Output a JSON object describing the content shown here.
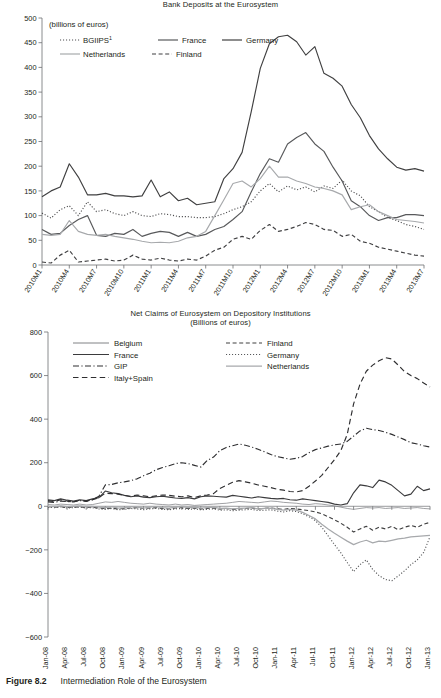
{
  "figure": {
    "number": "Figure 8.2",
    "caption": "Intermediation Role of the Eurosystem"
  },
  "chart_data": [
    {
      "id": "top",
      "type": "line",
      "title": "Bank Deposits at the Eurosystem",
      "subtitle": "(billions of euros)",
      "axis_note": "(billions of euros)",
      "xlabel": "",
      "ylabel": "",
      "ylim": [
        0,
        500
      ],
      "yticks": [
        0,
        50,
        100,
        150,
        200,
        250,
        300,
        350,
        400,
        450,
        500
      ],
      "grid": false,
      "legend_position": "top-left",
      "x": [
        "2010M1",
        "2010M2",
        "2010M3",
        "2010M4",
        "2010M5",
        "2010M6",
        "2010M7",
        "2010M8",
        "2010M9",
        "2010M10",
        "2010M11",
        "2010M12",
        "2011M1",
        "2011M2",
        "2011M3",
        "2011M4",
        "2011M5",
        "2011M6",
        "2011M7",
        "2011M8",
        "2011M9",
        "2011M10",
        "2011M11",
        "2011M12",
        "2012M1",
        "2012M2",
        "2012M3",
        "2012M4",
        "2012M5",
        "2012M6",
        "2012M7",
        "2012M8",
        "2012M9",
        "2012M10",
        "2012M11",
        "2012M12",
        "2013M1",
        "2013M2",
        "2013M3",
        "2013M4",
        "2013M5",
        "2013M6",
        "2013M7"
      ],
      "xticks": [
        "2010M1",
        "2010M4",
        "2010M7",
        "2010M10",
        "2011M1",
        "2011M4",
        "2011M7",
        "2011M10",
        "2012M1",
        "2012M4",
        "2012M7",
        "2012M10",
        "2013M1",
        "2013M4",
        "2013M7"
      ],
      "series": [
        {
          "name": "BGIIPS",
          "style": "dotted",
          "color": "#4d4d4f",
          "values": [
            105,
            95,
            112,
            120,
            100,
            128,
            108,
            112,
            104,
            100,
            108,
            100,
            98,
            104,
            102,
            98,
            98,
            96,
            96,
            98,
            104,
            112,
            118,
            128,
            150,
            165,
            148,
            160,
            152,
            158,
            148,
            160,
            155,
            172,
            150,
            140,
            118,
            108,
            96,
            90,
            82,
            78,
            72
          ]
        },
        {
          "name": "France",
          "style": "solid",
          "color": "#58595b",
          "values": [
            72,
            62,
            64,
            80,
            92,
            100,
            60,
            58,
            64,
            62,
            72,
            58,
            64,
            68,
            66,
            58,
            66,
            58,
            62,
            72,
            78,
            92,
            108,
            148,
            185,
            215,
            208,
            245,
            258,
            268,
            245,
            230,
            198,
            170,
            130,
            118,
            100,
            90,
            96,
            96,
            102,
            102,
            100
          ]
        },
        {
          "name": "Germany",
          "style": "solid",
          "color": "#404041",
          "values": [
            138,
            150,
            158,
            205,
            178,
            142,
            142,
            145,
            140,
            140,
            138,
            140,
            172,
            138,
            148,
            130,
            135,
            122,
            125,
            128,
            175,
            195,
            228,
            310,
            398,
            448,
            462,
            465,
            452,
            425,
            442,
            388,
            378,
            362,
            325,
            298,
            262,
            235,
            215,
            198,
            192,
            195,
            190
          ]
        },
        {
          "name": "Netherlands",
          "style": "solid",
          "color": "#a7a9ac",
          "values": [
            62,
            60,
            62,
            90,
            68,
            62,
            60,
            62,
            58,
            55,
            52,
            48,
            45,
            46,
            45,
            48,
            55,
            58,
            68,
            100,
            132,
            165,
            170,
            158,
            175,
            200,
            178,
            178,
            170,
            165,
            158,
            155,
            150,
            142,
            112,
            118,
            122,
            108,
            100,
            92,
            90,
            88,
            85
          ]
        },
        {
          "name": "Finland",
          "style": "dashed",
          "color": "#3f3f41",
          "values": [
            6,
            4,
            20,
            30,
            6,
            8,
            10,
            12,
            8,
            10,
            20,
            12,
            10,
            14,
            10,
            8,
            12,
            10,
            18,
            30,
            36,
            52,
            58,
            52,
            70,
            82,
            68,
            72,
            78,
            86,
            82,
            72,
            70,
            58,
            62,
            48,
            44,
            36,
            32,
            28,
            24,
            20,
            18
          ]
        }
      ]
    },
    {
      "id": "bottom",
      "type": "line",
      "title": "Net Claims of Eurosystem on Depository Institutions",
      "subtitle": "(Billions of euros)",
      "xlabel": "",
      "ylabel": "",
      "ylim": [
        -600,
        800
      ],
      "yticks": [
        -600,
        -400,
        -200,
        0,
        200,
        400,
        600,
        800
      ],
      "grid": false,
      "legend_position": "top",
      "x": [
        "Jan-08",
        "Feb-08",
        "Mar-08",
        "Apr-08",
        "May-08",
        "Jun-08",
        "Jul-08",
        "Aug-08",
        "Sep-08",
        "Oct-08",
        "Nov-08",
        "Dec-08",
        "Jan-09",
        "Feb-09",
        "Mar-09",
        "Apr-09",
        "May-09",
        "Jun-09",
        "Jul-09",
        "Aug-09",
        "Sep-09",
        "Oct-09",
        "Nov-09",
        "Dec-09",
        "Jan-10",
        "Feb-10",
        "Mar-10",
        "Apr-10",
        "May-10",
        "Jun-10",
        "Jul-10",
        "Aug-10",
        "Sep-10",
        "Oct-10",
        "Nov-10",
        "Dec-10",
        "Jan-11",
        "Feb-11",
        "Mar-11",
        "Apr-11",
        "May-11",
        "Jun-11",
        "Jul-11",
        "Aug-11",
        "Sep-11",
        "Oct-11",
        "Nov-11",
        "Dec-11",
        "Jan-12",
        "Feb-12",
        "Mar-12",
        "Apr-12",
        "May-12",
        "Jun-12",
        "Jul-12",
        "Aug-12",
        "Sep-12",
        "Oct-12",
        "Nov-12",
        "Dec-12",
        "Jan-13"
      ],
      "xticks": [
        "Jan-08",
        "Apr-08",
        "Jul-08",
        "Oct-08",
        "Jan-09",
        "Apr-09",
        "Jul-09",
        "Oct-09",
        "Jan-10",
        "Apr-10",
        "Jul-10",
        "Oct-10",
        "Jan-11",
        "Apr-11",
        "Jul-11",
        "Oct-11",
        "Jan-12",
        "Apr-12",
        "Jul-12",
        "Oct-12",
        "Jan-13"
      ],
      "series": [
        {
          "name": "Belgium",
          "style": "solid-thin",
          "color": "#808285",
          "values": [
            8,
            6,
            10,
            8,
            6,
            10,
            6,
            8,
            14,
            20,
            18,
            22,
            18,
            14,
            12,
            10,
            14,
            10,
            8,
            6,
            10,
            6,
            8,
            4,
            6,
            8,
            10,
            12,
            14,
            18,
            22,
            20,
            18,
            16,
            20,
            24,
            22,
            18,
            16,
            14,
            10,
            8,
            12,
            10,
            6,
            2,
            -4,
            -10,
            -14,
            -10,
            -6,
            -8,
            -6,
            -10,
            -8,
            -6,
            -10,
            -8,
            -6,
            -10,
            -12
          ]
        },
        {
          "name": "France",
          "style": "solid",
          "color": "#3b3b3d",
          "values": [
            30,
            26,
            34,
            28,
            24,
            30,
            26,
            34,
            40,
            70,
            62,
            58,
            50,
            44,
            48,
            42,
            40,
            44,
            46,
            42,
            38,
            36,
            40,
            34,
            44,
            48,
            46,
            44,
            42,
            50,
            46,
            42,
            38,
            44,
            40,
            36,
            34,
            36,
            30,
            28,
            34,
            30,
            26,
            22,
            18,
            10,
            6,
            12,
            62,
            98,
            94,
            86,
            120,
            112,
            96,
            72,
            48,
            56,
            92,
            72,
            80
          ]
        },
        {
          "name": "GIP",
          "style": "dashdot",
          "color": "#2e2e30",
          "values": [
            20,
            18,
            24,
            22,
            20,
            26,
            24,
            30,
            46,
            98,
            100,
            108,
            112,
            118,
            126,
            140,
            152,
            168,
            178,
            186,
            196,
            200,
            196,
            188,
            180,
            210,
            226,
            256,
            270,
            278,
            286,
            280,
            272,
            262,
            250,
            238,
            228,
            222,
            216,
            220,
            228,
            246,
            260,
            268,
            276,
            282,
            286,
            298,
            322,
            346,
            358,
            352,
            348,
            340,
            330,
            318,
            306,
            292,
            286,
            278,
            272
          ]
        },
        {
          "name": "Italy+Spain",
          "style": "dashed-wide",
          "color": "#2e2e30",
          "values": [
            26,
            22,
            30,
            24,
            20,
            28,
            22,
            30,
            40,
            60,
            58,
            56,
            50,
            46,
            52,
            48,
            44,
            48,
            52,
            50,
            46,
            44,
            48,
            40,
            48,
            52,
            58,
            82,
            96,
            110,
            118,
            112,
            106,
            98,
            92,
            86,
            78,
            74,
            68,
            66,
            72,
            92,
            116,
            142,
            178,
            214,
            256,
            330,
            470,
            560,
            620,
            648,
            668,
            682,
            676,
            648,
            618,
            600,
            586,
            566,
            548
          ]
        },
        {
          "name": "Finland",
          "style": "dashed",
          "color": "#404041",
          "values": [
            -2,
            -4,
            -2,
            -6,
            -4,
            -2,
            -6,
            -4,
            -8,
            -10,
            -8,
            -12,
            -10,
            -8,
            -6,
            -10,
            -8,
            -6,
            -10,
            -12,
            -8,
            -6,
            -10,
            -8,
            -12,
            -10,
            -8,
            -12,
            -10,
            -14,
            -12,
            -10,
            -8,
            -12,
            -10,
            -8,
            -12,
            -14,
            -10,
            -12,
            -16,
            -20,
            -26,
            -34,
            -48,
            -62,
            -78,
            -96,
            -118,
            -104,
            -92,
            -110,
            -96,
            -104,
            -92,
            -108,
            -96,
            -88,
            -96,
            -82,
            -74
          ]
        },
        {
          "name": "Germany",
          "style": "dotted",
          "color": "#58595b",
          "values": [
            -4,
            -6,
            -2,
            -8,
            -6,
            -4,
            -8,
            -6,
            -12,
            -14,
            -10,
            -16,
            -14,
            -10,
            -12,
            -16,
            -12,
            -10,
            -14,
            -16,
            -12,
            -10,
            -14,
            -12,
            -16,
            -14,
            -12,
            -18,
            -16,
            -20,
            -18,
            -16,
            -14,
            -20,
            -18,
            -16,
            -22,
            -26,
            -20,
            -24,
            -34,
            -48,
            -66,
            -96,
            -136,
            -176,
            -214,
            -258,
            -300,
            -268,
            -246,
            -290,
            -318,
            -336,
            -342,
            -320,
            -296,
            -268,
            -246,
            -212,
            -140
          ]
        },
        {
          "name": "Netherlands",
          "style": "solid-gray",
          "color": "#a7a9ac",
          "values": [
            0,
            -2,
            2,
            -2,
            0,
            2,
            -2,
            0,
            -4,
            -6,
            -2,
            -8,
            -6,
            -2,
            -4,
            -8,
            -4,
            -2,
            -6,
            -8,
            -4,
            -2,
            -6,
            -4,
            -8,
            -6,
            -4,
            -10,
            -8,
            -12,
            -10,
            -8,
            -6,
            -12,
            -10,
            -8,
            -14,
            -18,
            -14,
            -18,
            -28,
            -42,
            -58,
            -82,
            -104,
            -124,
            -142,
            -160,
            -176,
            -164,
            -156,
            -168,
            -160,
            -162,
            -156,
            -150,
            -146,
            -140,
            -138,
            -136,
            -134
          ]
        }
      ]
    }
  ]
}
